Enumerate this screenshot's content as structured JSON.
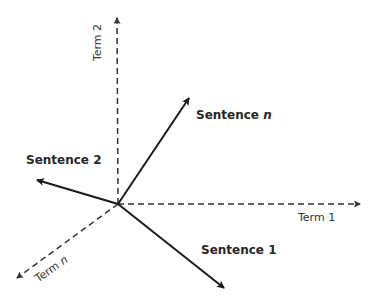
{
  "diagram": {
    "type": "vector-space-model",
    "origin": [
      118,
      204
    ],
    "axes": [
      {
        "id": "term1",
        "label": "Term 1",
        "label_var": "",
        "style": "dashed",
        "end": [
          362,
          204
        ]
      },
      {
        "id": "term2",
        "label": "Term 2",
        "label_var": "",
        "style": "dashed",
        "end": [
          117,
          16
        ]
      },
      {
        "id": "termn",
        "label": "Term ",
        "label_var": "n",
        "style": "dashed",
        "end": [
          15,
          279
        ]
      }
    ],
    "vectors": [
      {
        "id": "sentence1",
        "label": "Sentence 1",
        "label_var": "",
        "style": "solid",
        "end": [
          226,
          289
        ]
      },
      {
        "id": "sentence2",
        "label": "Sentence 2",
        "label_var": "",
        "style": "solid",
        "end": [
          35,
          179
        ]
      },
      {
        "id": "sentencen",
        "label": "Sentence ",
        "label_var": "n",
        "style": "solid",
        "end": [
          190,
          96
        ]
      }
    ],
    "colors": {
      "line": "#1a1a1a",
      "dashed": "#333333"
    }
  }
}
